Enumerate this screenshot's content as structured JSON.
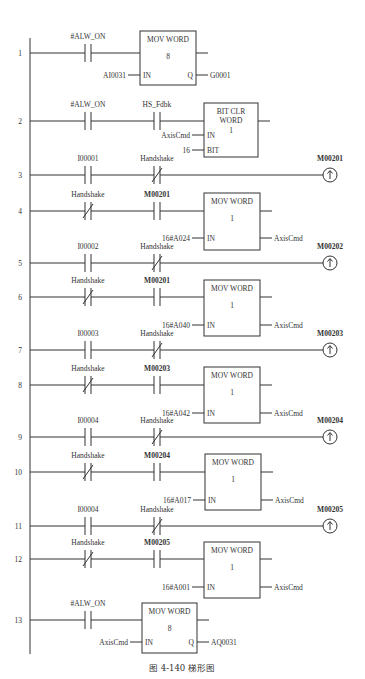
{
  "diagram": {
    "type": "ladder-logic",
    "caption": "图 4-140   梯形图",
    "rungs": [
      {
        "num": "1",
        "y": 53,
        "elements": [
          {
            "kind": "contact_no",
            "x": 88,
            "label": "#ALW_ON",
            "bold": false
          },
          {
            "kind": "block",
            "x": 140,
            "w": 56,
            "top": 31,
            "h": 54,
            "title": [
              "MOV WORD"
            ],
            "param": "8",
            "pins": [
              {
                "side": "in",
                "name": "IN",
                "y": 75,
                "wire": "AI0031"
              },
              {
                "side": "out",
                "name": "Q",
                "y": 75,
                "wire": "G0001"
              }
            ]
          }
        ]
      },
      {
        "num": "2",
        "y": 121,
        "elements": [
          {
            "kind": "contact_no",
            "x": 88,
            "label": "#ALW_ON",
            "bold": false
          },
          {
            "kind": "contact_no",
            "x": 157,
            "label": "HS_Fdbk",
            "bold": false
          },
          {
            "kind": "block",
            "x": 204,
            "w": 54,
            "top": 103,
            "h": 54,
            "title": [
              "BIT  CLR",
              "WORD"
            ],
            "param": "1",
            "pins": [
              {
                "side": "in",
                "name": "IN",
                "y": 135,
                "wire": "AxisCmd"
              },
              {
                "side": "in",
                "name": "BIT",
                "y": 150,
                "wire": "16"
              }
            ]
          }
        ]
      },
      {
        "num": "3",
        "y": 175,
        "elements": [
          {
            "kind": "contact_no",
            "x": 88,
            "label": "I00001",
            "bold": false
          },
          {
            "kind": "contact_nc",
            "x": 157,
            "label": "Handshake",
            "bold": false
          },
          {
            "kind": "coil_pos",
            "x": 330,
            "label": "M00201"
          }
        ]
      },
      {
        "num": "4",
        "y": 211,
        "elements": [
          {
            "kind": "contact_nc",
            "x": 88,
            "label": "Handshake",
            "bold": false
          },
          {
            "kind": "contact_no",
            "x": 157,
            "label": "M00201",
            "bold": true
          },
          {
            "kind": "block",
            "x": 204,
            "w": 56,
            "top": 193,
            "h": 57,
            "title": [
              "MOV WORD"
            ],
            "param": "1",
            "pins": [
              {
                "side": "in",
                "name": "IN",
                "y": 238,
                "wire": "16#A024"
              },
              {
                "side": "out",
                "name": "",
                "y": 238,
                "wire": "AxisCmd"
              }
            ]
          }
        ]
      },
      {
        "num": "5",
        "y": 263,
        "elements": [
          {
            "kind": "contact_no",
            "x": 88,
            "label": "I00002",
            "bold": false
          },
          {
            "kind": "contact_nc",
            "x": 157,
            "label": "Handshake",
            "bold": false
          },
          {
            "kind": "coil_pos",
            "x": 330,
            "label": "M00202"
          }
        ]
      },
      {
        "num": "6",
        "y": 297,
        "elements": [
          {
            "kind": "contact_nc",
            "x": 88,
            "label": "Handshake",
            "bold": false
          },
          {
            "kind": "contact_no",
            "x": 157,
            "label": "M00201",
            "bold": true
          },
          {
            "kind": "block",
            "x": 204,
            "w": 56,
            "top": 280,
            "h": 56,
            "title": [
              "MOV WORD"
            ],
            "param": "1",
            "pins": [
              {
                "side": "in",
                "name": "IN",
                "y": 325,
                "wire": "16#A040"
              },
              {
                "side": "out",
                "name": "",
                "y": 325,
                "wire": "AxisCmd"
              }
            ]
          }
        ]
      },
      {
        "num": "7",
        "y": 350,
        "elements": [
          {
            "kind": "contact_no",
            "x": 88,
            "label": "I00003",
            "bold": false
          },
          {
            "kind": "contact_nc",
            "x": 157,
            "label": "Handshake",
            "bold": false
          },
          {
            "kind": "coil_pos",
            "x": 330,
            "label": "M00203"
          }
        ]
      },
      {
        "num": "8",
        "y": 385,
        "elements": [
          {
            "kind": "contact_nc",
            "x": 88,
            "label": "Handshake",
            "bold": false
          },
          {
            "kind": "contact_no",
            "x": 157,
            "label": "M00203",
            "bold": true
          },
          {
            "kind": "block",
            "x": 204,
            "w": 56,
            "top": 367,
            "h": 56,
            "title": [
              "MOV WORD"
            ],
            "param": "1",
            "pins": [
              {
                "side": "in",
                "name": "IN",
                "y": 413,
                "wire": "16#A042"
              },
              {
                "side": "out",
                "name": "",
                "y": 413,
                "wire": "AxisCmd"
              }
            ]
          }
        ]
      },
      {
        "num": "9",
        "y": 437,
        "elements": [
          {
            "kind": "contact_no",
            "x": 88,
            "label": "I00004",
            "bold": false
          },
          {
            "kind": "contact_nc",
            "x": 157,
            "label": "Handshake",
            "bold": false
          },
          {
            "kind": "coil_pos",
            "x": 330,
            "label": "M00204"
          }
        ]
      },
      {
        "num": "10",
        "y": 472,
        "elements": [
          {
            "kind": "contact_nc",
            "x": 88,
            "label": "Handshake",
            "bold": false
          },
          {
            "kind": "contact_no",
            "x": 157,
            "label": "M00204",
            "bold": true
          },
          {
            "kind": "block",
            "x": 205,
            "w": 56,
            "top": 454,
            "h": 56,
            "title": [
              "MOV WORD"
            ],
            "param": "1",
            "pins": [
              {
                "side": "in",
                "name": "IN",
                "y": 500,
                "wire": "16#A017"
              },
              {
                "side": "out",
                "name": "",
                "y": 500,
                "wire": "AxisCmd"
              }
            ]
          }
        ]
      },
      {
        "num": "11",
        "y": 526,
        "elements": [
          {
            "kind": "contact_no",
            "x": 88,
            "label": "I00004",
            "bold": false
          },
          {
            "kind": "contact_nc",
            "x": 157,
            "label": "Handshake",
            "bold": false
          },
          {
            "kind": "coil_pos",
            "x": 330,
            "label": "M00205"
          }
        ]
      },
      {
        "num": "12",
        "y": 559,
        "elements": [
          {
            "kind": "contact_nc",
            "x": 88,
            "label": "Handshake",
            "bold": false
          },
          {
            "kind": "contact_no",
            "x": 157,
            "label": "M00205",
            "bold": true
          },
          {
            "kind": "block",
            "x": 204,
            "w": 56,
            "top": 542,
            "h": 56,
            "title": [
              "MOV WORD"
            ],
            "param": "1",
            "pins": [
              {
                "side": "in",
                "name": "IN",
                "y": 587,
                "wire": "16#A001"
              },
              {
                "side": "out",
                "name": "",
                "y": 587,
                "wire": "AxisCmd"
              }
            ]
          }
        ]
      },
      {
        "num": "13",
        "y": 620,
        "elements": [
          {
            "kind": "contact_no",
            "x": 88,
            "label": "#ALW_ON",
            "bold": false
          },
          {
            "kind": "block",
            "x": 142,
            "w": 55,
            "top": 603,
            "h": 50,
            "title": [
              "MOV WORD"
            ],
            "param": "8",
            "pins": [
              {
                "side": "in",
                "name": "IN",
                "y": 642,
                "wire": "AxisCmd"
              },
              {
                "side": "out",
                "name": "Q",
                "y": 642,
                "wire": "AQ0031"
              }
            ]
          }
        ]
      }
    ],
    "rail": {
      "x": 30,
      "top": 38,
      "bottom": 654
    },
    "colors": {
      "line": "#333333",
      "background": "#ffffff"
    }
  }
}
